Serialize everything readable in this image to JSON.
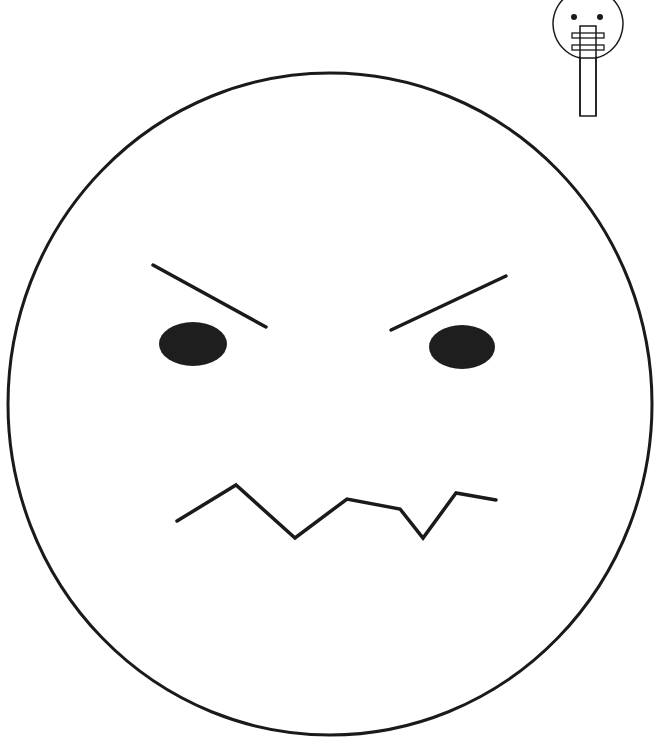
{
  "colors": {
    "stroke": "#1a1a1a",
    "fill": "#ffffff",
    "feature": "#1e1e1e"
  },
  "face": {
    "cx": 330,
    "cy": 404,
    "rx": 322,
    "ry": 331,
    "expression": "angry"
  },
  "thumbnail": {
    "label": "face-on-stick",
    "description": "Small face puppet on a stick with mouth taped"
  }
}
